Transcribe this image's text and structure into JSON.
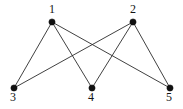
{
  "figure": {
    "name": "undirected-graph-diagram",
    "width": 183,
    "height": 109,
    "background_color": "#ffffff",
    "edge_color": "#2b2b2b",
    "vertex_color": "#111111",
    "label_color": "#141414"
  },
  "chart_data": {
    "type": "diagram",
    "graph_type": "undirected-simple-graph",
    "title": "",
    "nodes": [
      {
        "id": "1",
        "label": "1",
        "x": 52,
        "y": 22,
        "row": "top",
        "degree": 3,
        "label_x": 49,
        "label_y": 3
      },
      {
        "id": "2",
        "label": "2",
        "x": 133,
        "y": 22,
        "row": "top",
        "degree": 3,
        "label_x": 130,
        "label_y": 3
      },
      {
        "id": "3",
        "label": "3",
        "x": 14,
        "y": 88,
        "row": "bottom",
        "degree": 2,
        "label_x": 10,
        "label_y": 91
      },
      {
        "id": "4",
        "label": "4",
        "x": 92,
        "y": 88,
        "row": "bottom",
        "degree": 2,
        "label_x": 88,
        "label_y": 91
      },
      {
        "id": "5",
        "label": "5",
        "x": 170,
        "y": 88,
        "row": "bottom",
        "degree": 2,
        "label_x": 166,
        "label_y": 91
      }
    ],
    "edges": [
      {
        "source": "1",
        "target": "3"
      },
      {
        "source": "1",
        "target": "4"
      },
      {
        "source": "1",
        "target": "5"
      },
      {
        "source": "2",
        "target": "3"
      },
      {
        "source": "2",
        "target": "4"
      },
      {
        "source": "2",
        "target": "5"
      }
    ],
    "node_count": 5,
    "edge_count": 6,
    "vertex_radius": 3.1,
    "legend": [],
    "annotations": []
  }
}
